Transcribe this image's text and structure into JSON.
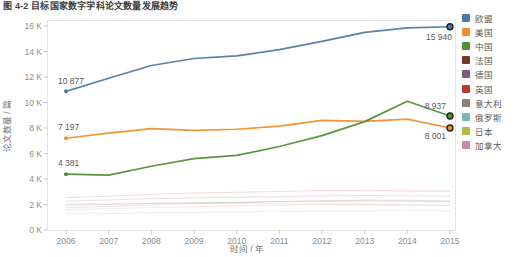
{
  "figure": {
    "title": "图 4-2  目标国家数字学科论文数量发展趋势"
  },
  "chart_data": {
    "type": "line",
    "x": [
      "2006",
      "2007",
      "2008",
      "2009",
      "2010",
      "2011",
      "2012",
      "2013",
      "2014",
      "2015"
    ],
    "xlabel": "时间 / 年",
    "ylabel": "论文数量 / 篇",
    "ylim": [
      0,
      16000
    ],
    "yticks": [
      "0 K",
      "2 K",
      "4 K",
      "6 K",
      "8 K",
      "10 K",
      "12 K",
      "14 K",
      "16 K"
    ],
    "grid": false,
    "legend_position": "right",
    "frame_color": "#e2e2e2",
    "axis_color": "#c8c8c8",
    "tick_label_color": "#8c8c8c",
    "data_label_color": "#595959",
    "series": [
      {
        "id": "eu",
        "name": "欧盟",
        "color": "#4e79a7",
        "emphasized": true,
        "values": [
          10877,
          11900,
          12900,
          13450,
          13650,
          14150,
          14800,
          15500,
          15850,
          15940
        ]
      },
      {
        "id": "usa",
        "name": "美国",
        "color": "#f28e2b",
        "emphasized": true,
        "values": [
          7197,
          7600,
          7950,
          7820,
          7900,
          8150,
          8600,
          8520,
          8700,
          8001
        ]
      },
      {
        "id": "china",
        "name": "中国",
        "color": "#4f9136",
        "emphasized": true,
        "values": [
          4381,
          4300,
          5000,
          5600,
          5850,
          6550,
          7400,
          8500,
          10100,
          8937
        ]
      },
      {
        "id": "france",
        "name": "法国",
        "color": "#77352b",
        "emphasized": false,
        "values": [
          1950,
          2000,
          2080,
          2130,
          2180,
          2230,
          2280,
          2280,
          2250,
          2230
        ]
      },
      {
        "id": "germany",
        "name": "德国",
        "color": "#7b5d84",
        "emphasized": false,
        "values": [
          2280,
          2350,
          2450,
          2520,
          2580,
          2620,
          2680,
          2700,
          2690,
          2650
        ]
      },
      {
        "id": "uk",
        "name": "英国",
        "color": "#b63b32",
        "emphasized": false,
        "values": [
          2550,
          2650,
          2800,
          2900,
          2960,
          3020,
          3100,
          3080,
          3070,
          3050
        ]
      },
      {
        "id": "italy",
        "name": "意大利",
        "color": "#8c8279",
        "emphasized": false,
        "values": [
          1750,
          1850,
          1960,
          2060,
          2140,
          2230,
          2300,
          2340,
          2330,
          2300
        ]
      },
      {
        "id": "russia",
        "name": "俄罗斯",
        "color": "#79b8b2",
        "emphasized": false,
        "values": [
          1280,
          1300,
          1350,
          1380,
          1420,
          1450,
          1480,
          1500,
          1530,
          1500
        ]
      },
      {
        "id": "japan",
        "name": "日本",
        "color": "#b2b844",
        "emphasized": false,
        "values": [
          2080,
          2080,
          2120,
          2120,
          2090,
          2050,
          2030,
          1990,
          1950,
          1900
        ]
      },
      {
        "id": "canada",
        "name": "加拿大",
        "color": "#c78ba5",
        "emphasized": false,
        "values": [
          1600,
          1670,
          1760,
          1830,
          1890,
          1950,
          2000,
          2010,
          2000,
          1960
        ]
      }
    ],
    "markers": [
      {
        "s": 0,
        "i": 0,
        "r": 2,
        "ring": false
      },
      {
        "s": 1,
        "i": 0,
        "r": 2,
        "ring": false
      },
      {
        "s": 2,
        "i": 0,
        "r": 2,
        "ring": false
      },
      {
        "s": 0,
        "i": 9,
        "r": 3,
        "ring": true
      },
      {
        "s": 1,
        "i": 9,
        "r": 3,
        "ring": true
      },
      {
        "s": 2,
        "i": 9,
        "r": 3,
        "ring": true
      }
    ],
    "point_labels": [
      {
        "s": 0,
        "i": 0,
        "text": "10 877",
        "dx": -8,
        "dy": -7,
        "anchor": "start"
      },
      {
        "s": 1,
        "i": 0,
        "text": "7 197",
        "dx": -8,
        "dy": -8,
        "anchor": "start"
      },
      {
        "s": 2,
        "i": 0,
        "text": "4 381",
        "dx": -8,
        "dy": -8,
        "anchor": "start"
      },
      {
        "s": 0,
        "i": 9,
        "text": "15 940",
        "dx": 2,
        "dy": 13,
        "anchor": "end"
      },
      {
        "s": 2,
        "i": 9,
        "text": "8 937",
        "dx": -4,
        "dy": -7,
        "anchor": "end"
      },
      {
        "s": 1,
        "i": 9,
        "text": "8 001",
        "dx": -4,
        "dy": 11,
        "anchor": "end"
      }
    ]
  }
}
